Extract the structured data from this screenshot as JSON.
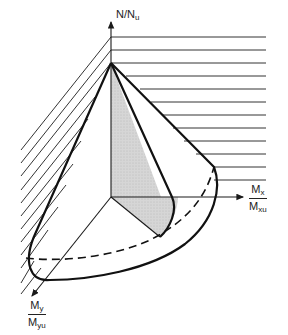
{
  "figure": {
    "type": "3D interaction (failure) surface diagram",
    "axes": {
      "vertical": {
        "label_main": "N/N",
        "label_sub": "u"
      },
      "x": {
        "num_main": "M",
        "num_sub": "x",
        "den_main": "M",
        "den_sub": "xu"
      },
      "y": {
        "num_main": "M",
        "num_sub": "y",
        "den_main": "M",
        "den_sub": "yu"
      }
    },
    "colors": {
      "line": "#1a1a1a",
      "shading": "#cfcfcf",
      "background": "#ffffff"
    }
  }
}
